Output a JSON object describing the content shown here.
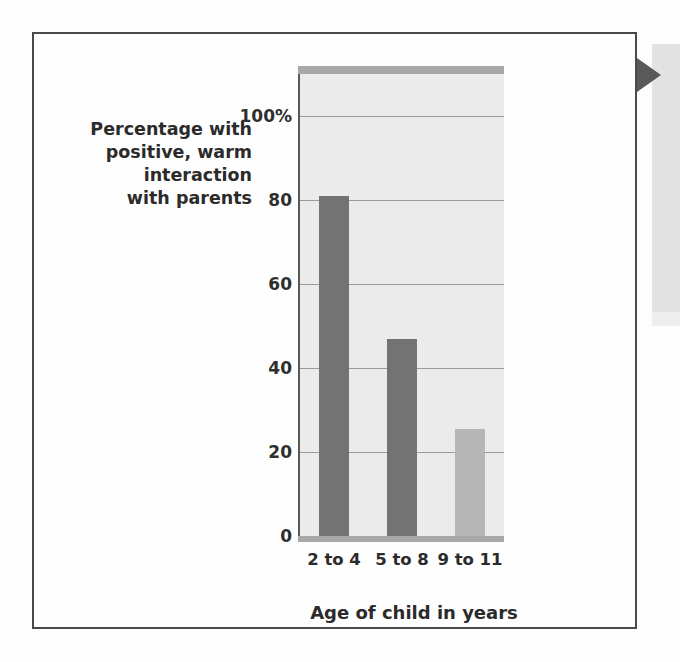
{
  "figure": {
    "arrow_tab_name": "callout-arrow",
    "border_color": "#4a4a4a"
  },
  "y_axis_caption": {
    "line1": "Percentage with",
    "line2": "positive, warm",
    "line3": "interaction",
    "line4": "with parents"
  },
  "chart_data": {
    "type": "bar",
    "title": "",
    "subtitle": "",
    "xlabel": "Age of child in years",
    "ylabel": "Percentage with positive, warm interaction with parents",
    "categories": [
      "2 to 4",
      "5 to 8",
      "9 to 11"
    ],
    "values": [
      81,
      47,
      25.5
    ],
    "series": [
      {
        "name": "Percentage with positive, warm interaction with parents",
        "values": [
          81,
          47,
          25.5
        ]
      }
    ],
    "bar_colors": [
      "#737373",
      "#737373",
      "#b6b6b6"
    ],
    "ylim": [
      0,
      110
    ],
    "ytick_values": [
      0,
      20,
      40,
      60,
      80,
      100
    ],
    "ytick_labels": [
      "0",
      "20",
      "40",
      "60",
      "80",
      "100%"
    ],
    "gridlines": true,
    "grid_axis": "y",
    "legend": false,
    "legend_position": "none",
    "plot_background": "#ebebeb",
    "gridline_color": "#9a9a9a",
    "axis_color": "#5a5a5a"
  }
}
